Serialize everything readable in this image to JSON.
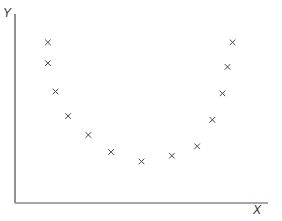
{
  "chart_data": {
    "type": "scatter",
    "title": "",
    "xlabel": "X",
    "ylabel": "Y",
    "marker": "x",
    "grid": false,
    "legend": null,
    "xlim": [
      0,
      10
    ],
    "ylim": [
      0,
      10
    ],
    "points": [
      {
        "x": 1.3,
        "y": 8.5
      },
      {
        "x": 1.3,
        "y": 7.4
      },
      {
        "x": 1.6,
        "y": 5.9
      },
      {
        "x": 2.1,
        "y": 4.6
      },
      {
        "x": 2.9,
        "y": 3.6
      },
      {
        "x": 3.8,
        "y": 2.7
      },
      {
        "x": 5.0,
        "y": 2.2
      },
      {
        "x": 6.2,
        "y": 2.5
      },
      {
        "x": 7.2,
        "y": 3.0
      },
      {
        "x": 7.8,
        "y": 4.4
      },
      {
        "x": 8.2,
        "y": 5.8
      },
      {
        "x": 8.4,
        "y": 7.2
      },
      {
        "x": 8.6,
        "y": 8.5
      }
    ]
  },
  "colors": {
    "axis": "#555555",
    "marker": "#444444"
  }
}
